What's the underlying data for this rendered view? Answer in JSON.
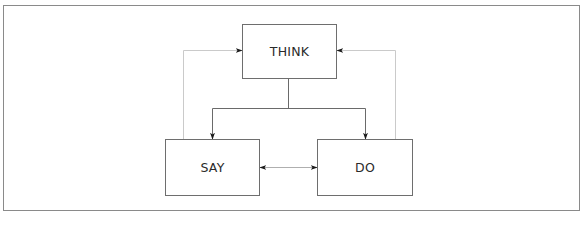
{
  "diagram": {
    "type": "flow",
    "nodes": [
      {
        "id": "think",
        "label": "THINK",
        "x": 242,
        "y": 24,
        "w": 95,
        "h": 55
      },
      {
        "id": "say",
        "label": "SAY",
        "x": 165,
        "y": 139,
        "w": 95,
        "h": 57
      },
      {
        "id": "do",
        "label": "DO",
        "x": 317,
        "y": 139,
        "w": 96,
        "h": 57
      }
    ],
    "edges": [
      {
        "from": "think",
        "to": "say",
        "style": "solid",
        "direction": "forward"
      },
      {
        "from": "think",
        "to": "do",
        "style": "solid",
        "direction": "forward"
      },
      {
        "from": "say",
        "to": "do",
        "style": "thin",
        "direction": "both"
      },
      {
        "from": "say",
        "to": "think",
        "style": "light-gray",
        "direction": "forward"
      },
      {
        "from": "do",
        "to": "think",
        "style": "light-gray",
        "direction": "forward"
      }
    ],
    "colors": {
      "frame": "#8a8a8a",
      "box_border": "#6e6e6e",
      "solid_line": "#6a6a6a",
      "feedback_line": "#c4c4c4",
      "arrowhead": "#1a1a1a",
      "text": "#2a2a2a"
    }
  }
}
